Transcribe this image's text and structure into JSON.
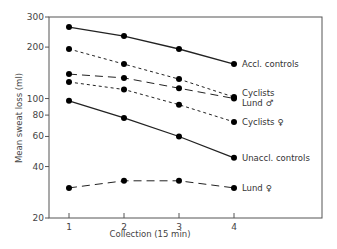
{
  "chart_data": {
    "type": "line",
    "title": "",
    "xlabel": "Collection (15 min)",
    "ylabel": "Mean sweat loss (ml)",
    "yscale": "log",
    "ylim": [
      20,
      300
    ],
    "yticks": [
      20,
      40,
      60,
      80,
      100,
      200,
      300
    ],
    "x": [
      1,
      2,
      3,
      4
    ],
    "xticks": [
      "1",
      "2",
      "3",
      "4"
    ],
    "grid": false,
    "legend_position": "inline labels at right of last point",
    "series": [
      {
        "name": "Accl. controls",
        "style": "solid",
        "values": [
          262,
          232,
          195,
          159
        ]
      },
      {
        "name": "Cyclists",
        "style": "short-dash",
        "values": [
          195,
          159,
          130,
          102
        ]
      },
      {
        "name": "Lund ♂",
        "style": "long-dash",
        "values": [
          139,
          132,
          115,
          100
        ]
      },
      {
        "name": "Cyclists ♀",
        "style": "short-dash",
        "values": [
          125,
          113,
          92,
          73
        ]
      },
      {
        "name": "Unaccl. controls",
        "style": "solid",
        "values": [
          97,
          77,
          60,
          45
        ]
      },
      {
        "name": "Lund ♀",
        "style": "long-dash",
        "values": [
          30,
          33,
          33,
          30
        ]
      }
    ]
  },
  "labels": {
    "ylabel": "Mean sweat loss (ml)",
    "xlabel": "Collection (15 min)"
  }
}
